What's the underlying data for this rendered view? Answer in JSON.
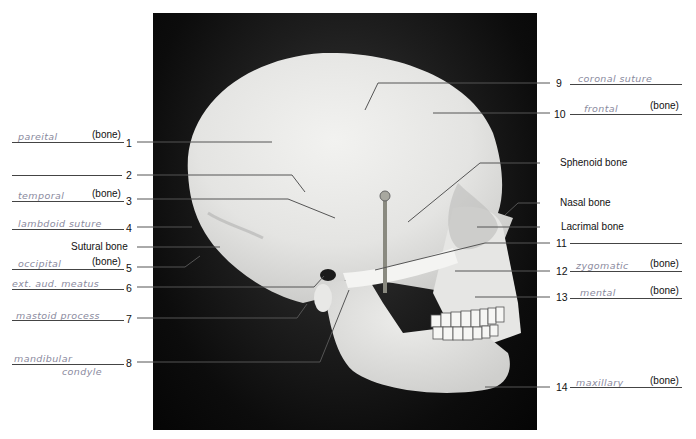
{
  "figure": {
    "bone_suffix": "(bone)"
  },
  "left_labels": [
    {
      "number": "1",
      "answer": "pareital",
      "suffix": "(bone)"
    },
    {
      "number": "2",
      "answer": "",
      "suffix": ""
    },
    {
      "number": "3",
      "answer": "temporal",
      "suffix": "(bone)"
    },
    {
      "number": "4",
      "answer": "lambdoid suture",
      "suffix": ""
    },
    {
      "number": "",
      "printed": "Sutural bone"
    },
    {
      "number": "5",
      "answer": "occipital",
      "suffix": "(bone)"
    },
    {
      "number": "6",
      "answer": "ext. aud. meatus",
      "suffix": ""
    },
    {
      "number": "7",
      "answer": "mastoid process",
      "suffix": ""
    },
    {
      "number": "8",
      "answer": "mandibular",
      "answer_line2": "condyle",
      "suffix": ""
    }
  ],
  "right_labels": [
    {
      "number": "9",
      "answer": "coronal suture",
      "suffix": ""
    },
    {
      "number": "10",
      "answer": "frontal",
      "suffix": "(bone)"
    },
    {
      "number": "",
      "printed": "Sphenoid bone"
    },
    {
      "number": "",
      "printed": "Nasal bone"
    },
    {
      "number": "",
      "printed": "Lacrimal bone"
    },
    {
      "number": "11",
      "answer": "",
      "suffix": ""
    },
    {
      "number": "12",
      "answer": "zygomatic",
      "suffix": "(bone)"
    },
    {
      "number": "13",
      "answer": "mental",
      "suffix": "(bone)"
    },
    {
      "number": "14",
      "answer": "maxillary",
      "suffix": "(bone)"
    }
  ]
}
